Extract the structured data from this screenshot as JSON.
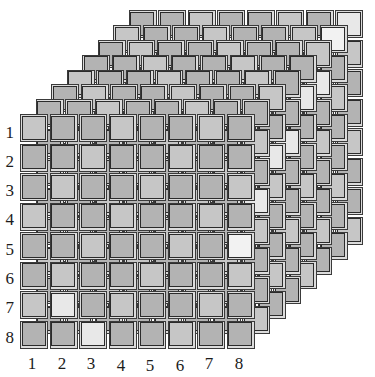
{
  "figure": {
    "type": "3d-stacked-grid",
    "background_color": "#ffffff",
    "layers": 8,
    "rows": 8,
    "cols": 8
  },
  "axes": {
    "y_axis": {
      "name": "row-index",
      "ticks": [
        "1",
        "2",
        "3",
        "4",
        "5",
        "6",
        "7",
        "8"
      ]
    },
    "x_axis": {
      "name": "column-index",
      "ticks": [
        "1",
        "2",
        "3",
        "4",
        "5",
        "6",
        "7",
        "8"
      ]
    }
  },
  "style": {
    "tile_fill": "#b3b3b3",
    "tile_fill_light": "#c6c6c6",
    "tile_highlight": "#e8e8e8",
    "tile_highlight_strong": "#f2f2f2",
    "tile_edge_dark": "#3a3a3a",
    "tile_edge_light": "#dcdcdc",
    "outline": "#2b2b2b",
    "label_color": "#1c1c1c"
  },
  "geometry": {
    "front_origin_x": 20,
    "front_origin_y": 114,
    "cell_pitch": 29.5,
    "tile_size": 25,
    "layer_dx": 15.5,
    "layer_dy": -14.8
  },
  "chart_data": {
    "type": "heatmap",
    "title": "",
    "xlabel": "",
    "ylabel": "",
    "categories_x": [
      "1",
      "2",
      "3",
      "4",
      "5",
      "6",
      "7",
      "8"
    ],
    "categories_y": [
      "1",
      "2",
      "3",
      "4",
      "5",
      "6",
      "7",
      "8"
    ],
    "layers": 8,
    "grid": true,
    "legend": "none",
    "value_range": [
      0.0,
      1.0
    ],
    "highlight_cells": [
      {
        "layer": 0,
        "row": 5,
        "col": 8,
        "value": 0.95
      },
      {
        "layer": 1,
        "row": 4,
        "col": 8,
        "value": 0.82
      },
      {
        "layer": 2,
        "row": 3,
        "col": 8,
        "value": 0.78
      },
      {
        "layer": 3,
        "row": 3,
        "col": 8,
        "value": 0.74
      },
      {
        "layer": 4,
        "row": 2,
        "col": 8,
        "value": 0.8
      },
      {
        "layer": 5,
        "row": 2,
        "col": 8,
        "value": 0.76
      },
      {
        "layer": 6,
        "row": 1,
        "col": 8,
        "value": 0.88
      },
      {
        "layer": 7,
        "row": 1,
        "col": 8,
        "value": 0.84
      },
      {
        "layer": 0,
        "row": 7,
        "col": 2,
        "value": 0.7
      },
      {
        "layer": 0,
        "row": 8,
        "col": 3,
        "value": 0.68
      }
    ],
    "base_value": 0.45
  }
}
